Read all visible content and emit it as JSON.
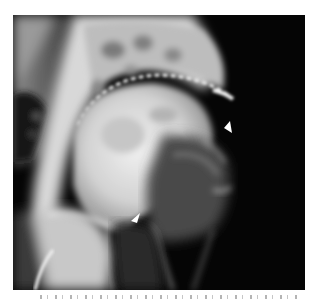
{
  "figure": {
    "background_color": "#050505",
    "bone_color": "#e6e6e6",
    "arrow_color": "#ffffff",
    "arrows": [
      {
        "name": "upper-right-arrow",
        "x": 224,
        "y": 126,
        "direction": "down-left"
      },
      {
        "name": "lower-arrow",
        "x": 134,
        "y": 216,
        "direction": "down-left"
      }
    ]
  }
}
